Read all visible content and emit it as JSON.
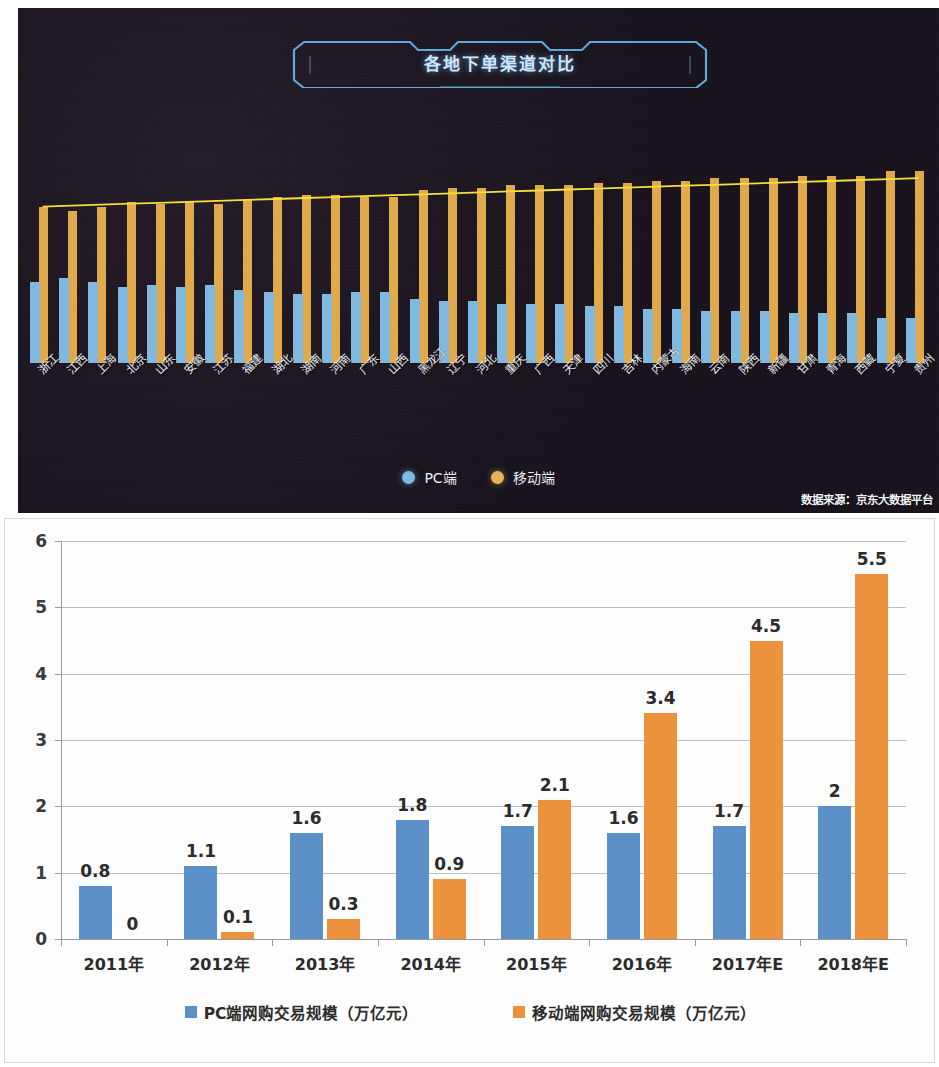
{
  "top_chart": {
    "title": "各地下单渠道对比",
    "legend": [
      {
        "key": "pc",
        "label": "PC端",
        "color": "#7fb8e0"
      },
      {
        "key": "mobile",
        "label": "移动端",
        "color": "#e5b257"
      }
    ],
    "source_note": "数据来源：京东大数据平台",
    "chart_data": {
      "type": "bar",
      "title": "各地下单渠道对比",
      "xlabel": "",
      "ylabel": "",
      "grid": false,
      "legend_position": "bottom",
      "ylim": [
        0,
        100
      ],
      "categories": [
        "浙江",
        "江西",
        "上海",
        "北京",
        "山东",
        "安徽",
        "江苏",
        "福建",
        "湖北",
        "湖南",
        "河南",
        "广东",
        "山西",
        "黑龙江",
        "辽宁",
        "河北",
        "重庆",
        "广西",
        "天津",
        "四川",
        "吉林",
        "内蒙古",
        "海南",
        "云南",
        "陕西",
        "新疆",
        "甘肃",
        "青海",
        "西藏",
        "宁夏",
        "贵州"
      ],
      "series": [
        {
          "name": "PC端",
          "color": "#81b8df",
          "values": [
            34,
            36,
            34,
            32,
            33,
            32,
            33,
            31,
            30,
            29,
            29,
            30,
            30,
            27,
            26,
            26,
            25,
            25,
            25,
            24,
            24,
            23,
            23,
            22,
            22,
            22,
            21,
            21,
            21,
            19,
            19
          ]
        },
        {
          "name": "移动端",
          "color": "#e0a94a",
          "values": [
            66,
            64,
            66,
            68,
            67,
            68,
            67,
            69,
            70,
            71,
            71,
            70,
            70,
            73,
            74,
            74,
            75,
            75,
            75,
            76,
            76,
            77,
            77,
            78,
            78,
            78,
            79,
            79,
            79,
            81,
            81
          ]
        }
      ],
      "trend_line": {
        "name": "移动端占比趋势",
        "color": "#f4e03a",
        "values": [
          66,
          66.4,
          66.8,
          67.2,
          67.6,
          68,
          68.4,
          68.8,
          69.2,
          69.6,
          70,
          70.4,
          70.8,
          71.2,
          71.6,
          72,
          72.4,
          72.8,
          73.2,
          73.6,
          74,
          74.4,
          74.8,
          75.2,
          75.6,
          76,
          76.4,
          76.8,
          77.2,
          77.6,
          78
        ]
      }
    }
  },
  "bottom_chart": {
    "legend": [
      {
        "key": "pc",
        "label": "PC端网购交易规模（万亿元）",
        "color": "#5b8fc7"
      },
      {
        "key": "mobile",
        "label": "移动端网购交易规模（万亿元）",
        "color": "#ed923c"
      }
    ],
    "chart_data": {
      "type": "bar",
      "title": "",
      "xlabel": "",
      "ylabel": "",
      "grid": true,
      "legend_position": "bottom",
      "ylim": [
        0,
        6
      ],
      "yticks": [
        0,
        1,
        2,
        3,
        4,
        5,
        6
      ],
      "categories": [
        "2011年",
        "2012年",
        "2013年",
        "2014年",
        "2015年",
        "2016年",
        "2017年E",
        "2018年E"
      ],
      "series": [
        {
          "name": "PC端网购交易规模（万亿元）",
          "color": "#5b8fc7",
          "values": [
            0.8,
            1.1,
            1.6,
            1.8,
            1.7,
            1.6,
            1.7,
            2
          ],
          "labels": [
            "0.8",
            "1.1",
            "1.6",
            "1.8",
            "1.7",
            "1.6",
            "1.7",
            "2"
          ]
        },
        {
          "name": "移动端网购交易规模（万亿元）",
          "color": "#ed923c",
          "values": [
            0,
            0.1,
            0.3,
            0.9,
            2.1,
            3.4,
            4.5,
            5.5
          ],
          "labels": [
            "0",
            "0.1",
            "0.3",
            "0.9",
            "2.1",
            "3.4",
            "4.5",
            "5.5"
          ]
        }
      ]
    }
  }
}
